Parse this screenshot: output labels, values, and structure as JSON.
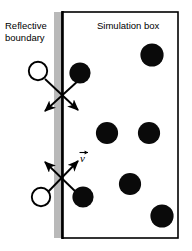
{
  "figure": {
    "title_absent": true,
    "background_color": "#ffffff",
    "labels": {
      "reflective_boundary": "Reflective\nboundary",
      "reflective_boundary_line1": "Reflective",
      "reflective_boundary_line2": "boundary",
      "simulation_box": "Simulation box",
      "velocity_vector": "v"
    },
    "colors": {
      "stroke": "#000000",
      "particle_fill": "#0a0a0a",
      "ghost_fill": "#ffffff",
      "shadow_band": "#b9b9b9",
      "box_fill": "#ffffff"
    },
    "box": {
      "left": 62,
      "top": 12,
      "right": 178,
      "bottom": 238,
      "stroke_width": 1.6
    },
    "shadow_band": {
      "x": 54,
      "y": 12,
      "width": 8,
      "height": 226
    },
    "boundary_line": {
      "x": 62,
      "y_top": 12,
      "y_bottom": 238,
      "stroke_width": 2.2
    },
    "particles": [
      {
        "name": "particle-incoming-top",
        "cx": 80,
        "cy": 73,
        "r": 10.5,
        "filled": true
      },
      {
        "name": "particle-top-right",
        "cx": 152,
        "cy": 55,
        "r": 11.5,
        "filled": true
      },
      {
        "name": "particle-mid-left",
        "cx": 107,
        "cy": 133,
        "r": 11.0,
        "filled": true
      },
      {
        "name": "particle-mid-right",
        "cx": 149,
        "cy": 133,
        "r": 11.0,
        "filled": true
      },
      {
        "name": "particle-lower-mid",
        "cx": 130,
        "cy": 184,
        "r": 11.0,
        "filled": true
      },
      {
        "name": "particle-bottom-right",
        "cx": 162,
        "cy": 216,
        "r": 11.5,
        "filled": true
      },
      {
        "name": "particle-incoming-bottom",
        "cx": 83,
        "cy": 197,
        "r": 10.5,
        "filled": true
      }
    ],
    "ghost_particles": [
      {
        "name": "ghost-particle-top",
        "cx": 38,
        "cy": 71,
        "r": 9.0
      },
      {
        "name": "ghost-particle-bottom",
        "cx": 41,
        "cy": 197,
        "r": 9.0
      }
    ],
    "collisions": [
      {
        "name": "collision-cross-top",
        "cx": 62,
        "cy": 95,
        "arrows": [
          {
            "name": "arrow-top-reflected-left",
            "x1": 80,
            "y1": 81,
            "x2": 44,
            "y2": 112
          },
          {
            "name": "arrow-top-reflected-right",
            "x1": 45,
            "y1": 79,
            "x2": 80,
            "y2": 112
          }
        ],
        "connectors": [
          {
            "name": "connector-ghost-top",
            "x1": 45,
            "y1": 79,
            "x2": 80,
            "y2": 112
          }
        ]
      },
      {
        "name": "collision-cross-bottom",
        "cx": 62,
        "cy": 178,
        "arrows": [
          {
            "name": "arrow-bottom-incident-upleft",
            "x1": 76,
            "y1": 192,
            "x2": 44,
            "y2": 161
          },
          {
            "name": "arrow-bottom-velocity-upright",
            "x1": 46,
            "y1": 193,
            "x2": 79,
            "y2": 160
          }
        ]
      }
    ]
  }
}
